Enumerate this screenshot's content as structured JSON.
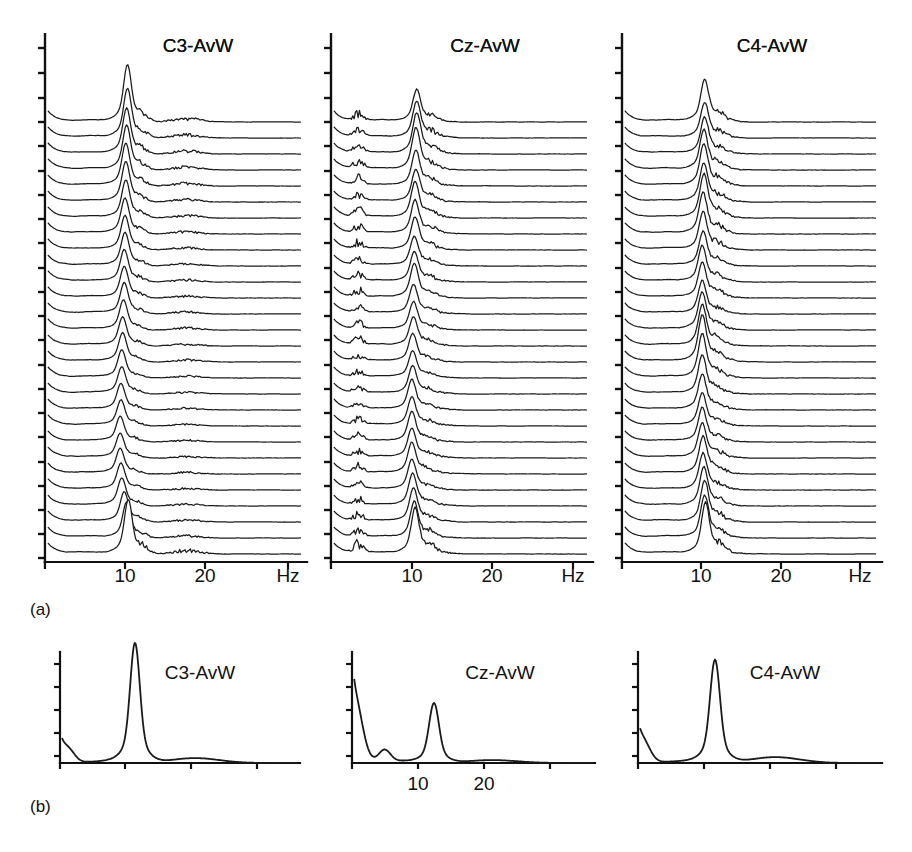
{
  "figure": {
    "background": "#ffffff",
    "ink": "#111111",
    "width": 912,
    "height": 852
  },
  "panels": {
    "a": {
      "label": "(a)",
      "label_x": 30,
      "label_y": 615,
      "plots": [
        {
          "channel": "C3-AvW",
          "label_x": 198,
          "label_y": 52,
          "axis": {
            "x0": 45,
            "x1": 307,
            "ybase": 562,
            "ytop": 34
          },
          "xticks": [
            {
              "value": 0,
              "px": 45,
              "text": ""
            },
            {
              "value": 10,
              "px": 125,
              "text": "10"
            },
            {
              "value": 20,
              "px": 205,
              "text": "20"
            },
            {
              "value": 30,
              "px": 288,
              "text": "Hz"
            }
          ],
          "yticks_px": [
            48,
            73,
            98,
            122,
            146,
            171,
            195,
            219,
            243,
            268,
            292,
            316,
            340,
            365,
            389,
            413,
            437,
            462,
            486,
            510,
            534,
            558
          ]
        },
        {
          "channel": "Cz-AvW",
          "label_x": 485,
          "label_y": 52,
          "axis": {
            "x0": 331,
            "x1": 593,
            "ybase": 562,
            "ytop": 34
          },
          "xticks": [
            {
              "value": 0,
              "px": 331,
              "text": ""
            },
            {
              "value": 10,
              "px": 412,
              "text": "10"
            },
            {
              "value": 20,
              "px": 492,
              "text": "20"
            },
            {
              "value": 30,
              "px": 573,
              "text": "Hz"
            }
          ],
          "yticks_px": [
            48,
            73,
            98,
            122,
            146,
            171,
            195,
            219,
            243,
            268,
            292,
            316,
            340,
            365,
            389,
            413,
            437,
            462,
            486,
            510,
            534,
            558
          ]
        },
        {
          "channel": "C4-AvW",
          "label_x": 772,
          "label_y": 52,
          "axis": {
            "x0": 622,
            "x1": 882,
            "ybase": 562,
            "ytop": 34
          },
          "xticks": [
            {
              "value": 0,
              "px": 622,
              "text": ""
            },
            {
              "value": 10,
              "px": 701,
              "text": "10"
            },
            {
              "value": 20,
              "px": 781,
              "text": "20"
            },
            {
              "value": 30,
              "px": 860,
              "text": "Hz"
            }
          ],
          "yticks_px": [
            48,
            73,
            98,
            122,
            146,
            171,
            195,
            219,
            243,
            268,
            292,
            316,
            340,
            365,
            389,
            413,
            437,
            462,
            486,
            510,
            534,
            558
          ]
        }
      ],
      "trace_count": 28,
      "trace_top_px": 122,
      "trace_spacing_px": 16.0
    },
    "b": {
      "label": "(b)",
      "label_x": 30,
      "label_y": 812,
      "plots": [
        {
          "channel": "C3-AvW",
          "label_x": 200,
          "label_y": 679,
          "axis": {
            "x0": 60,
            "x1": 300,
            "ybase": 763,
            "ytop": 652
          },
          "xticks": [
            {
              "value": 0,
              "px": 60,
              "text": ""
            },
            {
              "value": 10,
              "px": 125,
              "text": ""
            },
            {
              "value": 20,
              "px": 191,
              "text": ""
            },
            {
              "value": 30,
              "px": 257,
              "text": ""
            }
          ],
          "yticks_px": [
            664,
            687,
            710,
            733,
            756
          ]
        },
        {
          "channel": "Cz-AvW",
          "label_x": 500,
          "label_y": 679,
          "axis": {
            "x0": 352,
            "x1": 595,
            "ybase": 763,
            "ytop": 652
          },
          "xticks": [
            {
              "value": 0,
              "px": 352,
              "text": ""
            },
            {
              "value": 10,
              "px": 418,
              "text": "10"
            },
            {
              "value": 20,
              "px": 484,
              "text": "20"
            },
            {
              "value": 30,
              "px": 550,
              "text": ""
            }
          ],
          "yticks_px": [
            664,
            687,
            710,
            733,
            756
          ]
        },
        {
          "channel": "C4-AvW",
          "label_x": 785,
          "label_y": 679,
          "axis": {
            "x0": 638,
            "x1": 882,
            "ybase": 763,
            "ytop": 652
          },
          "xticks": [
            {
              "value": 0,
              "px": 638,
              "text": ""
            },
            {
              "value": 10,
              "px": 704,
              "text": ""
            },
            {
              "value": 20,
              "px": 770,
              "text": ""
            },
            {
              "value": 30,
              "px": 836,
              "text": ""
            }
          ],
          "yticks_px": [
            664,
            687,
            710,
            733,
            756
          ]
        }
      ]
    }
  },
  "axis_text": {
    "hz_unit": "Hz",
    "tick_10": "10",
    "tick_20": "20"
  },
  "chart_data": {
    "type": "line",
    "title": "",
    "xlabel": "Hz",
    "ylabel": "",
    "xlim": [
      0,
      32
    ],
    "grid": false,
    "legend": "none",
    "panel_a": {
      "x_axis_ticks": [
        0,
        10,
        20,
        30
      ],
      "x_axis_tick_labels": [
        "",
        "10",
        "20",
        "Hz"
      ],
      "n_traces_per_panel": 28,
      "channels": [
        "C3-AvW",
        "Cz-AvW",
        "C4-AvW"
      ],
      "series": [
        {
          "name": "C3-AvW",
          "alpha_peak_hz": 10.2,
          "peak_amplitudes": [
            1.0,
            0.86,
            0.8,
            0.78,
            0.74,
            0.7,
            0.66,
            0.62,
            0.6,
            0.58,
            0.56,
            0.55,
            0.54,
            0.52,
            0.5,
            0.5,
            0.48,
            0.46,
            0.45,
            0.44,
            0.44,
            0.42,
            0.44,
            0.46,
            0.48,
            0.52,
            0.62,
            0.95
          ],
          "peak_centers_hz": [
            10.2,
            10.2,
            10.1,
            10.1,
            10.0,
            10.0,
            10.0,
            9.9,
            9.9,
            9.9,
            9.8,
            9.8,
            9.8,
            9.7,
            9.6,
            9.6,
            9.5,
            9.5,
            9.4,
            9.4,
            9.3,
            9.3,
            9.3,
            9.4,
            9.5,
            9.8,
            10.1,
            10.3
          ],
          "secondary_peak_hz": 17.5,
          "noise_level": 0.08
        },
        {
          "name": "Cz-AvW",
          "alpha_peak_hz": 10.6,
          "peak_amplitudes": [
            0.55,
            0.62,
            0.7,
            0.72,
            0.6,
            0.56,
            0.62,
            0.58,
            0.56,
            0.5,
            0.52,
            0.58,
            0.5,
            0.48,
            0.5,
            0.48,
            0.46,
            0.48,
            0.52,
            0.5,
            0.52,
            0.5,
            0.54,
            0.52,
            0.56,
            0.58,
            0.62,
            0.78
          ],
          "peak_centers_hz": [
            10.6,
            10.6,
            10.6,
            10.5,
            10.5,
            10.5,
            10.4,
            10.4,
            10.4,
            10.3,
            10.3,
            10.3,
            10.2,
            10.2,
            10.2,
            10.1,
            10.1,
            10.1,
            10.0,
            10.0,
            10.0,
            10.0,
            10.0,
            10.0,
            10.1,
            10.2,
            10.3,
            10.4
          ],
          "low_freq_peak_hz": 3.4,
          "secondary_peak_hz": 12.5,
          "noise_level": 0.08
        },
        {
          "name": "C4-AvW",
          "alpha_peak_hz": 10.3,
          "peak_amplitudes": [
            0.72,
            0.6,
            0.62,
            0.68,
            0.72,
            0.66,
            0.74,
            0.7,
            0.64,
            0.58,
            0.62,
            0.6,
            0.56,
            0.64,
            0.7,
            0.8,
            0.74,
            0.66,
            0.6,
            0.56,
            0.58,
            0.6,
            0.64,
            0.62,
            0.66,
            0.7,
            0.72,
            0.86
          ],
          "peak_centers_hz": [
            10.3,
            10.3,
            10.3,
            10.2,
            10.2,
            10.2,
            10.2,
            10.1,
            10.1,
            10.1,
            10.0,
            10.0,
            10.0,
            10.0,
            10.0,
            10.0,
            10.0,
            10.0,
            10.0,
            10.0,
            10.0,
            10.0,
            10.1,
            10.1,
            10.2,
            10.3,
            10.3,
            10.4
          ],
          "secondary_peak_hz": 12.0,
          "noise_level": 0.08
        }
      ]
    },
    "panel_b": {
      "x_axis_ticks": [
        0,
        10,
        20,
        30
      ],
      "x_axis_tick_labels_middle": [
        "",
        "10",
        "20",
        ""
      ],
      "channels": [
        "C3-AvW",
        "Cz-AvW",
        "C4-AvW"
      ],
      "series": [
        {
          "name": "C3-AvW",
          "main_peak_hz": 10.0,
          "main_peak_rel_height": 1.0,
          "dc_shoulder_hz": 1.2,
          "dc_shoulder_rel_height": 0.2,
          "broad_bump_hz": 18.0,
          "broad_bump_rel_height": 0.05
        },
        {
          "name": "Cz-AvW",
          "main_peak_hz": 10.8,
          "main_peak_rel_height": 0.5,
          "dc_shoulder_hz": 0.8,
          "dc_shoulder_rel_height": 0.62,
          "minor_peak_hz": 4.3,
          "minor_peak_rel_height": 0.12,
          "broad_bump_hz": 18.5,
          "broad_bump_rel_height": 0.03
        },
        {
          "name": "C4-AvW",
          "main_peak_hz": 10.1,
          "main_peak_rel_height": 0.86,
          "dc_shoulder_hz": 0.9,
          "dc_shoulder_rel_height": 0.26,
          "broad_bump_hz": 18.0,
          "broad_bump_rel_height": 0.06
        }
      ]
    }
  }
}
